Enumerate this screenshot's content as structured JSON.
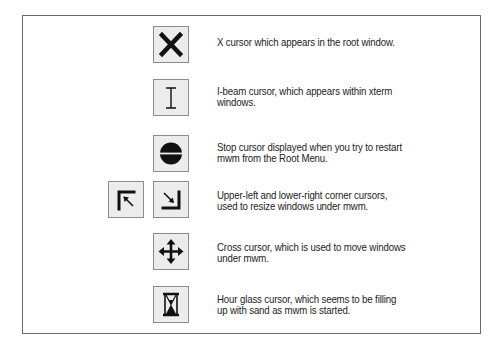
{
  "cursors": [
    {
      "id": "x-cursor",
      "icon": "x-cursor-icon",
      "lines": [
        "X cursor which appears in the root window."
      ]
    },
    {
      "id": "i-beam-cursor",
      "icon": "i-beam-cursor-icon",
      "lines": [
        "I-beam cursor, which appears within xterm",
        "windows."
      ]
    },
    {
      "id": "stop-cursor",
      "icon": "stop-cursor-icon",
      "lines": [
        "Stop cursor displayed when you try to restart",
        "mwm from the Root Menu."
      ]
    },
    {
      "id": "corner-cursors",
      "icons": [
        "upper-left-corner-cursor-icon",
        "lower-right-corner-cursor-icon"
      ],
      "lines": [
        "Upper-left and lower-right corner cursors,",
        "used to resize windows under mwm."
      ]
    },
    {
      "id": "cross-cursor",
      "icon": "cross-move-cursor-icon",
      "lines": [
        "Cross cursor, which is used to move windows",
        "under mwm."
      ]
    },
    {
      "id": "hourglass-cursor",
      "icon": "hourglass-cursor-icon",
      "lines": [
        "Hour glass cursor, which seems to be filling",
        "up with sand as mwm is started."
      ]
    }
  ],
  "colors": {
    "icon_background": "#ececec",
    "icon_border": "#8c8c8c",
    "icon_glyph": "#111111",
    "frame_border": "#6a6a6a",
    "text": "#222222"
  }
}
